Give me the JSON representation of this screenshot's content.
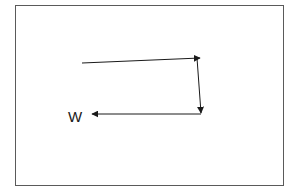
{
  "diagram": {
    "segments": [
      {
        "name": "segment-east",
        "direction": "east"
      },
      {
        "name": "segment-south",
        "direction": "south"
      },
      {
        "name": "segment-west",
        "direction": "west"
      }
    ],
    "label": "W",
    "stroke_color": "#1a1a1a",
    "frame_color": "#5a5a5a"
  }
}
